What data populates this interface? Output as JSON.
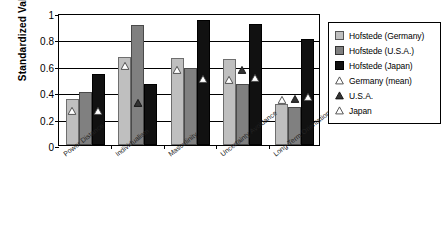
{
  "chart_data": {
    "type": "bar",
    "title": "",
    "xlabel": "",
    "ylabel": "Standardized Value",
    "ylim": [
      0,
      1
    ],
    "yticks": [
      "0",
      "0.2",
      "0.4",
      "0.6",
      "0.8",
      "1"
    ],
    "ytick_values": [
      0,
      0.2,
      0.4,
      0.6,
      0.8,
      1
    ],
    "grid": true,
    "legend_position": "right",
    "categories": [
      "Power Distance",
      "Individualism",
      "Masculinity",
      "Uncertainty Avoidance",
      "Long-Term Orientation"
    ],
    "series": [
      {
        "name": "Hofstede (Germany)",
        "type": "bar",
        "color": "#bfbfbf",
        "values": [
          0.35,
          0.67,
          0.66,
          0.65,
          0.31
        ]
      },
      {
        "name": "Hofstede (U.S.A.)",
        "type": "bar",
        "color": "#808080",
        "values": [
          0.4,
          0.91,
          0.58,
          0.46,
          0.29
        ]
      },
      {
        "name": "Hofstede (Japan)",
        "type": "bar",
        "color": "#111111",
        "values": [
          0.54,
          0.46,
          0.95,
          0.92,
          0.8
        ]
      },
      {
        "name": "Germany (mean)",
        "type": "marker",
        "marker": "open-triangle",
        "color": "#ffffff",
        "values": [
          0.26,
          0.6,
          0.57,
          0.49,
          0.34
        ]
      },
      {
        "name": "U.S.A.",
        "type": "marker",
        "marker": "filled-triangle",
        "color": "#333333",
        "values": [
          null,
          0.32,
          null,
          0.57,
          0.35
        ]
      },
      {
        "name": "Japan",
        "type": "marker",
        "marker": "open-triangle",
        "color": "#ffffff",
        "values": [
          0.26,
          null,
          0.5,
          0.51,
          0.36
        ]
      }
    ]
  },
  "legend": {
    "items": [
      {
        "label": "Hofstede (Germany)",
        "key": "swatch-light-gray"
      },
      {
        "label": "Hofstede (U.S.A.)",
        "key": "swatch-mid-gray"
      },
      {
        "label": "Hofstede (Japan)",
        "key": "swatch-black"
      },
      {
        "label": "Germany (mean)",
        "key": "open-triangle-icon"
      },
      {
        "label": "U.S.A.",
        "key": "filled-triangle-icon"
      },
      {
        "label": "Japan",
        "key": "open-triangle-icon"
      }
    ]
  }
}
